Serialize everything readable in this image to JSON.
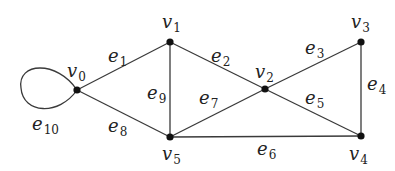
{
  "diagram": {
    "type": "undirected-graph",
    "background": "#ffffff",
    "stroke_color": "#3a3a3a",
    "node_color": "#111111",
    "nodes": [
      {
        "id": "v0",
        "base": "v",
        "sub": "0",
        "x": 77,
        "y": 90,
        "label_x": 67,
        "label_y": 77
      },
      {
        "id": "v1",
        "base": "v",
        "sub": "1",
        "x": 170,
        "y": 42,
        "label_x": 162,
        "label_y": 28
      },
      {
        "id": "v2",
        "base": "v",
        "sub": "2",
        "x": 265,
        "y": 89,
        "label_x": 255,
        "label_y": 78
      },
      {
        "id": "v3",
        "base": "v",
        "sub": "3",
        "x": 361,
        "y": 42,
        "label_x": 351,
        "label_y": 28
      },
      {
        "id": "v4",
        "base": "v",
        "sub": "4",
        "x": 361,
        "y": 136,
        "label_x": 349,
        "label_y": 160
      },
      {
        "id": "v5",
        "base": "v",
        "sub": "5",
        "x": 170,
        "y": 137,
        "label_x": 162,
        "label_y": 160
      }
    ],
    "edges": [
      {
        "id": "e1",
        "base": "e",
        "sub": "1",
        "from": "v0",
        "to": "v1",
        "label_x": 108,
        "label_y": 62
      },
      {
        "id": "e2",
        "base": "e",
        "sub": "2",
        "from": "v1",
        "to": "v2",
        "label_x": 211,
        "label_y": 62
      },
      {
        "id": "e3",
        "base": "e",
        "sub": "3",
        "from": "v2",
        "to": "v3",
        "label_x": 305,
        "label_y": 54
      },
      {
        "id": "e4",
        "base": "e",
        "sub": "4",
        "from": "v3",
        "to": "v4",
        "label_x": 367,
        "label_y": 90
      },
      {
        "id": "e5",
        "base": "e",
        "sub": "5",
        "from": "v2",
        "to": "v4",
        "label_x": 305,
        "label_y": 104
      },
      {
        "id": "e6",
        "base": "e",
        "sub": "6",
        "from": "v5",
        "to": "v4",
        "label_x": 257,
        "label_y": 155
      },
      {
        "id": "e7",
        "base": "e",
        "sub": "7",
        "from": "v5",
        "to": "v2",
        "label_x": 199,
        "label_y": 104
      },
      {
        "id": "e8",
        "base": "e",
        "sub": "8",
        "from": "v0",
        "to": "v5",
        "label_x": 108,
        "label_y": 132
      },
      {
        "id": "e9",
        "base": "e",
        "sub": "9",
        "from": "v1",
        "to": "v5",
        "label_x": 147,
        "label_y": 99
      },
      {
        "id": "e10",
        "base": "e",
        "sub": "10",
        "from": "v0",
        "to": "v0",
        "loop": true,
        "label_x": 32,
        "label_y": 130
      }
    ]
  }
}
